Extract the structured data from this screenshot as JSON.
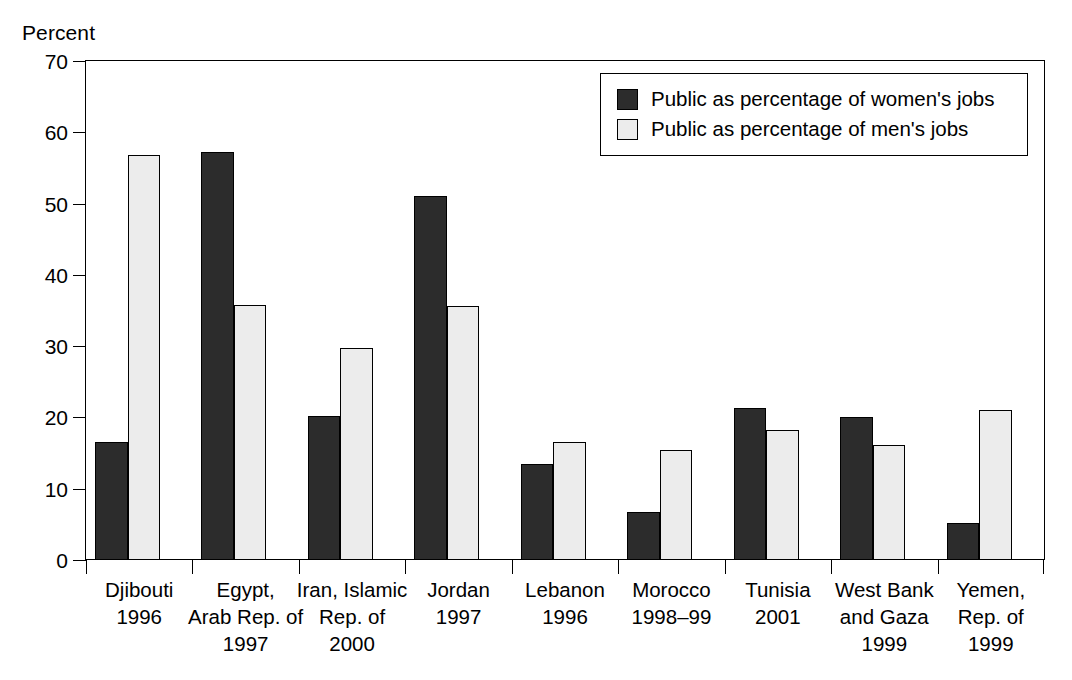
{
  "chart_data": {
    "type": "bar",
    "title": "",
    "xlabel": "",
    "ylabel": "Percent",
    "ylim": [
      0,
      70
    ],
    "yticks": [
      0,
      10,
      20,
      30,
      40,
      50,
      60,
      70
    ],
    "grid": false,
    "legend_position": "top-right",
    "categories": [
      "Djibouti\n1996",
      "Egypt,\nArab Rep. of\n1997",
      "Iran, Islamic\nRep. of\n2000",
      "Jordan\n1997",
      "Lebanon\n1996",
      "Morocco\n1998–99",
      "Tunisia\n2001",
      "West Bank\nand Gaza\n1999",
      "Yemen,\nRep. of\n1999"
    ],
    "category_lines": [
      [
        "Djibouti",
        "1996"
      ],
      [
        "Egypt,",
        "Arab Rep. of",
        "1997"
      ],
      [
        "Iran, Islamic",
        "Rep. of",
        "2000"
      ],
      [
        "Jordan",
        "1997"
      ],
      [
        "Lebanon",
        "1996"
      ],
      [
        "Morocco",
        "1998–99"
      ],
      [
        "Tunisia",
        "2001"
      ],
      [
        "West Bank",
        "and Gaza",
        "1999"
      ],
      [
        "Yemen,",
        "Rep. of",
        "1999"
      ]
    ],
    "series": [
      {
        "name": "Public as percentage of women's jobs",
        "color": "#2c2c2c",
        "values": [
          16.5,
          57.3,
          20.2,
          51.0,
          13.4,
          6.8,
          21.3,
          20.0,
          5.2
        ]
      },
      {
        "name": "Public as percentage of men's jobs",
        "color": "#ececec",
        "values": [
          56.8,
          35.8,
          29.8,
          35.6,
          16.5,
          15.5,
          18.2,
          16.2,
          21.1
        ]
      }
    ]
  },
  "legend": {
    "items": [
      {
        "label": "Public as percentage of women's jobs",
        "swatch": "dark"
      },
      {
        "label": "Public as percentage of men's jobs",
        "swatch": "light"
      }
    ]
  },
  "axis": {
    "y_unit_label": "Percent",
    "y_tick_labels": [
      "70",
      "60",
      "50",
      "40",
      "30",
      "20",
      "10",
      "0"
    ]
  }
}
